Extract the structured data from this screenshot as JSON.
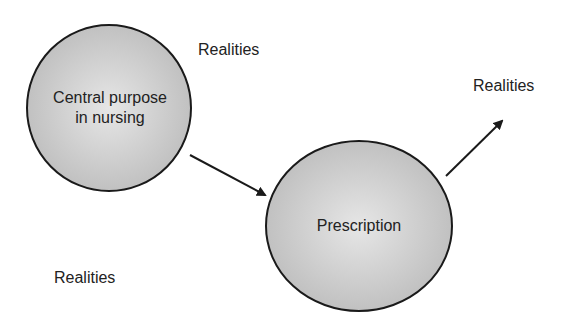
{
  "diagram": {
    "nodes": [
      {
        "id": "central",
        "label_line1": "Central purpose",
        "label_line2": "in nursing"
      },
      {
        "id": "prescription",
        "label": "Prescription"
      }
    ],
    "labels": {
      "realities_top": "Realities",
      "realities_right": "Realities",
      "realities_bottom": "Realities"
    },
    "edges": [
      {
        "from": "central",
        "to": "prescription"
      },
      {
        "from": "prescription",
        "to": "realities_right"
      }
    ],
    "colors": {
      "node_fill": "#c8c8c8",
      "node_stroke": "#1a1a1a",
      "arrow": "#1a1a1a",
      "text": "#222222"
    }
  }
}
